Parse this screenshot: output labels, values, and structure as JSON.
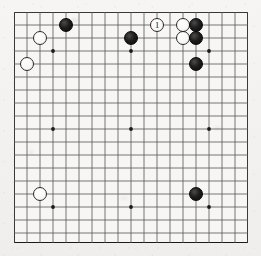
{
  "diagram": {
    "kind": "go-board-diagram",
    "board_size": 19,
    "title": "",
    "colors": {
      "paper": "#f4f3f1",
      "board": "#f7f6f4",
      "line": "#55555a",
      "border": "#1a1a1a",
      "black_stone": "#111111",
      "white_stone": "#ffffff"
    },
    "geometry": {
      "origin_x": 14,
      "origin_y": 12,
      "span": 234,
      "cell": 13.0,
      "stone_diameter": 14.5,
      "line_width": 0.8,
      "edge_line_width": 1.6
    },
    "star_points": [
      {
        "col": 3,
        "row": 3
      },
      {
        "col": 9,
        "row": 3
      },
      {
        "col": 15,
        "row": 3
      },
      {
        "col": 3,
        "row": 9
      },
      {
        "col": 9,
        "row": 9
      },
      {
        "col": 15,
        "row": 9
      },
      {
        "col": 3,
        "row": 15
      },
      {
        "col": 9,
        "row": 15
      },
      {
        "col": 15,
        "row": 15
      }
    ],
    "stones": [
      {
        "color": "white",
        "col": 2,
        "row": 2,
        "label": ""
      },
      {
        "color": "white",
        "col": 1,
        "row": 4,
        "label": ""
      },
      {
        "color": "black",
        "col": 4,
        "row": 1,
        "label": ""
      },
      {
        "color": "black",
        "col": 9,
        "row": 2,
        "label": ""
      },
      {
        "color": "white",
        "col": 11,
        "row": 1,
        "label": "1"
      },
      {
        "color": "white",
        "col": 13,
        "row": 1,
        "label": ""
      },
      {
        "color": "white",
        "col": 13,
        "row": 2,
        "label": ""
      },
      {
        "color": "black",
        "col": 14,
        "row": 1,
        "label": ""
      },
      {
        "color": "black",
        "col": 14,
        "row": 2,
        "label": ""
      },
      {
        "color": "black",
        "col": 14,
        "row": 4,
        "label": ""
      },
      {
        "color": "white",
        "col": 2,
        "row": 14,
        "label": ""
      },
      {
        "color": "black",
        "col": 14,
        "row": 14,
        "label": ""
      }
    ],
    "move_markers": [
      {
        "number": "1",
        "color": "white",
        "col": 11,
        "row": 1
      }
    ],
    "caption": ""
  }
}
